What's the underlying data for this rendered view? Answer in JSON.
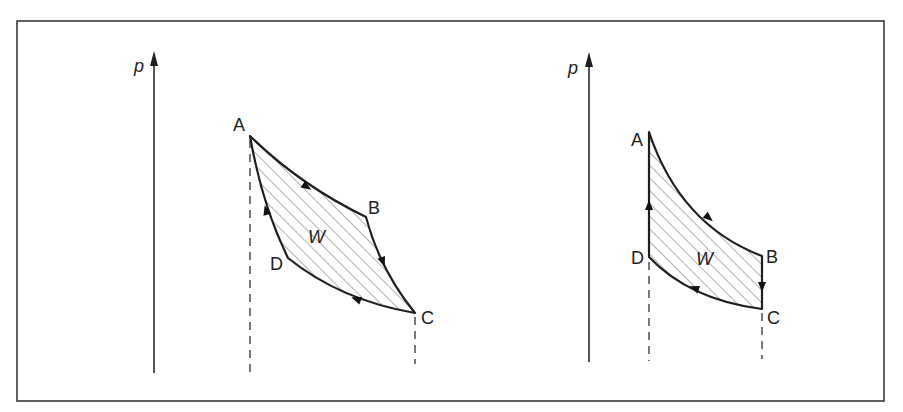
{
  "figure": {
    "frame_color": "#3a3a3a",
    "line_color": "#1e1e1e"
  },
  "diagrams": [
    {
      "id": "left",
      "axis_label": "p",
      "work_label": "W",
      "points": {
        "A": {
          "label": "A",
          "x": 250,
          "y": 136
        },
        "B": {
          "label": "B",
          "x": 366,
          "y": 217
        },
        "C": {
          "label": "C",
          "x": 415,
          "y": 313
        },
        "D": {
          "label": "D",
          "x": 288,
          "y": 258
        }
      },
      "cycle_direction": [
        "A→B",
        "B→C",
        "C→D",
        "D→A"
      ],
      "segments": {
        "AB": "curved expansion (downward)",
        "BC": "steeper curve downward",
        "CD": "curve leftward",
        "DA": "steep curve upward"
      }
    },
    {
      "id": "right",
      "axis_label": "p",
      "work_label": "W",
      "points": {
        "A": {
          "label": "A",
          "x": 649,
          "y": 132
        },
        "B": {
          "label": "B",
          "x": 762,
          "y": 256
        },
        "C": {
          "label": "C",
          "x": 762,
          "y": 309
        },
        "D": {
          "label": "D",
          "x": 649,
          "y": 257
        }
      },
      "cycle_direction": [
        "A→B",
        "B→C",
        "C→D",
        "D→A"
      ],
      "segments": {
        "AB": "curved expansion",
        "BC": "vertical drop (isochoric)",
        "CD": "curved compression",
        "DA": "vertical rise (isochoric)"
      }
    }
  ]
}
